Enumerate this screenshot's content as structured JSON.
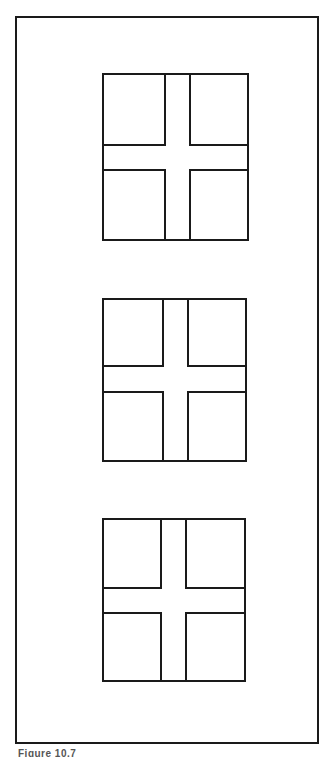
{
  "figure": {
    "caption": "Figure 10.7",
    "stroke_color": "#1a1a1a",
    "background": "#ffffff"
  },
  "windows": [
    {
      "left": 102,
      "top": 73,
      "width": 147,
      "height": 168,
      "vbar": [
        62,
        85
      ],
      "hbar": [
        71,
        94
      ]
    },
    {
      "left": 102,
      "top": 298,
      "width": 145,
      "height": 164,
      "vbar": [
        60,
        83
      ],
      "hbar": [
        67,
        91
      ]
    },
    {
      "left": 102,
      "top": 518,
      "width": 144,
      "height": 164,
      "vbar": [
        58,
        81
      ],
      "hbar": [
        69,
        92
      ]
    }
  ]
}
